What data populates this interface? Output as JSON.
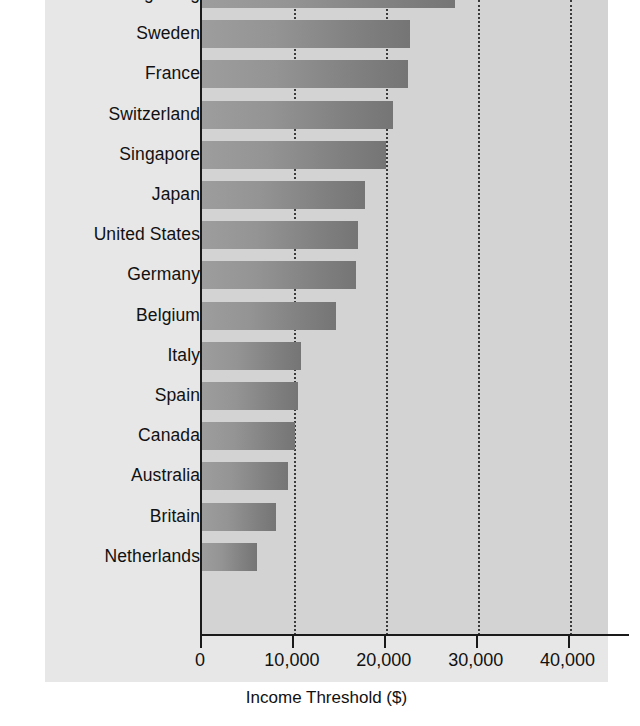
{
  "chart_data": {
    "type": "bar",
    "orientation": "horizontal",
    "title": "",
    "xlabel": "Income Threshold ($)",
    "ylabel": "",
    "xlim": [
      0,
      44400
    ],
    "xticks": [
      0,
      10000,
      20000,
      30000,
      40000
    ],
    "xtick_labels": [
      "0",
      "10,000",
      "20,000",
      "30,000",
      "40,000"
    ],
    "grid": "vertical-dotted",
    "legend": "none",
    "note": "Top category bar is clipped by the image crop",
    "categories": [
      "Hong Kong",
      "Sweden",
      "France",
      "Switzerland",
      "Singapore",
      "Japan",
      "United States",
      "Germany",
      "Belgium",
      "Italy",
      "Spain",
      "Canada",
      "Australia",
      "Britain",
      "Netherlands"
    ],
    "values": [
      27500,
      22600,
      22400,
      20800,
      20000,
      17700,
      17000,
      16800,
      14600,
      10800,
      10450,
      10100,
      9350,
      8100,
      6000
    ],
    "bar_color": "#8d8d8d",
    "plot_bg": "#d3d3d3",
    "figure_bg": "#e7e7e7",
    "axis_color": "#1a1a1a"
  }
}
